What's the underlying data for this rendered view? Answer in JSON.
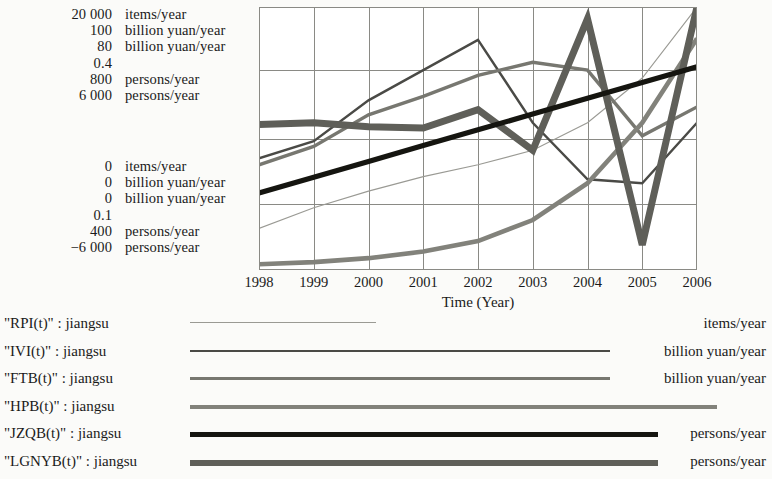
{
  "chart_data": {
    "type": "line",
    "title": "",
    "xlabel": "Time (Year)",
    "ylabel": "",
    "grid": true,
    "legend_position": "bottom",
    "x": [
      1998,
      1999,
      2000,
      2001,
      2002,
      2003,
      2004,
      2005,
      2006
    ],
    "xtick_labels": [
      "1998",
      "1999",
      "2000",
      "2001",
      "2002",
      "2003",
      "2004",
      "2005",
      "2006"
    ],
    "xlim": [
      1998,
      2006
    ],
    "note": "Each series is drawn on its own independent vertical scale; the maximum of each scale is listed in the upper-left value column and the minimum in the lower-left value column.",
    "series": [
      {
        "name": "\"RPI(t)\" : jiangsu",
        "unit": "items/year",
        "scale_max": "20 000",
        "scale_min": "0",
        "scale_max_value": 20000,
        "scale_min_value": 0,
        "style": "thin-light",
        "color": "#9a9a94",
        "width": 1.1,
        "values_scaled": [
          0.158,
          0.237,
          0.3,
          0.355,
          0.4,
          0.455,
          0.56,
          0.73,
          1.0
        ],
        "values": [
          3160,
          4740,
          6000,
          7100,
          8000,
          9100,
          11200,
          14600,
          20000
        ]
      },
      {
        "name": "\"IVI(t)\" : jiangsu",
        "unit": "billion yuan/year",
        "scale_max": "100",
        "scale_min": "0",
        "scale_max_value": 100,
        "scale_min_value": 0,
        "style": "thin-dark",
        "color": "#4a4a46",
        "width": 2.4,
        "values_scaled": [
          0.425,
          0.49,
          0.645,
          0.76,
          0.875,
          0.56,
          0.345,
          0.33,
          0.56
        ],
        "values": [
          42.5,
          49.0,
          64.5,
          76.0,
          87.5,
          56.0,
          34.5,
          33.0,
          56.0
        ]
      },
      {
        "name": "\"FTB(t)\" : jiangsu",
        "unit": "billion yuan/year",
        "scale_max": "80",
        "scale_min": "0",
        "scale_max_value": 80,
        "scale_min_value": 0,
        "style": "medium-gray",
        "color": "#777770",
        "width": 3.4,
        "values_scaled": [
          0.4,
          0.47,
          0.59,
          0.66,
          0.74,
          0.79,
          0.76,
          0.51,
          0.62
        ],
        "values": [
          32.0,
          37.6,
          47.2,
          52.8,
          59.2,
          63.2,
          60.8,
          40.8,
          49.6
        ]
      },
      {
        "name": "\"HPB(t)\" : jiangsu",
        "unit": "",
        "scale_max": "0.4",
        "scale_min": "0.1",
        "scale_max_value": 0.4,
        "scale_min_value": 0.1,
        "style": "thick-gray",
        "color": "#82827b",
        "width": 4.6,
        "values_scaled": [
          0.022,
          0.03,
          0.045,
          0.07,
          0.11,
          0.19,
          0.33,
          0.56,
          0.88
        ],
        "values": [
          0.107,
          0.109,
          0.114,
          0.121,
          0.133,
          0.157,
          0.199,
          0.268,
          0.364
        ]
      },
      {
        "name": "\"JZQB(t)\" : jiangsu",
        "unit": "persons/year",
        "scale_max": "800",
        "scale_min": "400",
        "scale_max_value": 800,
        "scale_min_value": 400,
        "style": "thick-black",
        "color": "#151510",
        "width": 5.2,
        "values_scaled": [
          0.293,
          0.353,
          0.413,
          0.473,
          0.533,
          0.593,
          0.653,
          0.713,
          0.773
        ],
        "values": [
          517,
          541,
          565,
          589,
          613,
          637,
          661,
          685,
          709
        ]
      },
      {
        "name": "\"LGNYB(t)\" : jiangsu",
        "unit": "persons/year",
        "scale_max": "6 000",
        "scale_min": "-6 000",
        "scale_max_value": 6000,
        "scale_min_value": -6000,
        "style": "very-thick-gray",
        "color": "#5f5f59",
        "width": 7.0,
        "values_scaled": [
          0.553,
          0.56,
          0.545,
          0.54,
          0.61,
          0.455,
          0.955,
          0.095,
          1.0
        ],
        "values": [
          640,
          720,
          540,
          480,
          1320,
          -540,
          5460,
          -4860,
          6000
        ]
      }
    ]
  },
  "axis_scales": {
    "max_rows": [
      {
        "value": "20 000",
        "unit": "items/year"
      },
      {
        "value": "100",
        "unit": "billion yuan/year"
      },
      {
        "value": "80",
        "unit": "billion yuan/year"
      },
      {
        "value": "0.4",
        "unit": ""
      },
      {
        "value": "800",
        "unit": "persons/year"
      },
      {
        "value": "6 000",
        "unit": "persons/year"
      }
    ],
    "min_rows": [
      {
        "value": "0",
        "unit": "items/year"
      },
      {
        "value": "0",
        "unit": "billion yuan/year"
      },
      {
        "value": "0",
        "unit": "billion yuan/year"
      },
      {
        "value": "0.1",
        "unit": ""
      },
      {
        "value": "400",
        "unit": "persons/year"
      },
      {
        "value": "−6 000",
        "unit": "persons/year"
      }
    ]
  },
  "xaxis": {
    "title": "Time (Year)",
    "ticks": [
      "1998",
      "1999",
      "2000",
      "2001",
      "2002",
      "2003",
      "2004",
      "2005",
      "2006"
    ]
  },
  "legend": {
    "entries": [
      {
        "label": "\"RPI(t)\" : jiangsu",
        "unit": "items/year",
        "color": "#9a9a94",
        "width": 1.1,
        "sample_width": 186
      },
      {
        "label": "\"IVI(t)\" : jiangsu",
        "unit": "billion yuan/year",
        "color": "#4a4a46",
        "width": 2.3,
        "sample_width": 420
      },
      {
        "label": "\"FTB(t)\" : jiangsu",
        "unit": "billion yuan/year",
        "color": "#777770",
        "width": 3.2,
        "sample_width": 420
      },
      {
        "label": "\"HPB(t)\" : jiangsu",
        "unit": "",
        "color": "#82827b",
        "width": 4.4,
        "sample_width": 527
      },
      {
        "label": "\"JZQB(t)\" : jiangsu",
        "unit": "persons/year",
        "color": "#151510",
        "width": 5.0,
        "sample_width": 468
      },
      {
        "label": "\"LGNYB(t)\" : jiangsu",
        "unit": "persons/year",
        "color": "#5f5f59",
        "width": 6.6,
        "sample_width": 468
      }
    ]
  },
  "style": {
    "background": "#fbfbf9",
    "frame_color": "#8a8a85",
    "grid_color": "#8a8a85",
    "text_color": "#1a1a1a"
  }
}
